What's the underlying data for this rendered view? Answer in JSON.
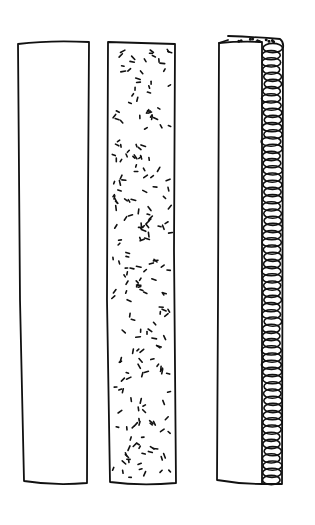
{
  "illustration": {
    "description": "Hand-drawn sketch of three fabric strips",
    "colors": {
      "background": "#ffffff",
      "ink": "#111111"
    },
    "strips": [
      {
        "id": "plain",
        "x": 18,
        "y": 41,
        "w": 71,
        "h": 443,
        "fill": "none"
      },
      {
        "id": "speckled",
        "x": 107,
        "y": 41,
        "w": 68,
        "h": 443,
        "fill": "speckles"
      },
      {
        "id": "serged-edge",
        "x": 217,
        "y": 36,
        "w": 66,
        "h": 448,
        "fill": "loops"
      }
    ]
  }
}
